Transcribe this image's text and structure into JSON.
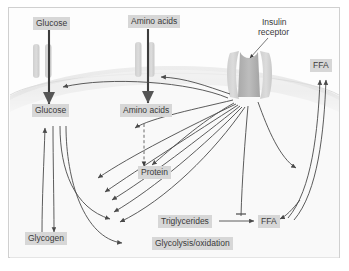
{
  "figure": {
    "frame": {
      "border_color": "#d0d0d0",
      "background": "#fdfdfd"
    },
    "style": {
      "label_box_fill": "#d7d7d7",
      "label_text_color": "#3a3a3a",
      "membrane_fill": "#e6e6e6",
      "transporter_fill": "#d2d2d2",
      "receptor_core_fill": "#b0b0b0",
      "arrow_color": "#4a4a4a"
    }
  },
  "extracellular": {
    "glucose": "Glucose",
    "amino_acids": "Amino acids",
    "insulin_receptor_line1": "Insulin",
    "insulin_receptor_line2": "receptor",
    "ffa": "FFA"
  },
  "intracellular": {
    "glucose": "Glucose",
    "amino_acids": "Amino acids",
    "protein": "Protein",
    "glycogen": "Glycogen",
    "triglycerides": "Triglycerides",
    "glycolysis": "Glycolysis/oxidation",
    "ffa": "FFA"
  },
  "nodes": [
    {
      "id": "glucose-out",
      "label": "Glucose",
      "compartment": "extracellular",
      "x": 33,
      "y": 18
    },
    {
      "id": "amino-acids-out",
      "label": "Amino acids",
      "compartment": "extracellular",
      "x": 130,
      "y": 16
    },
    {
      "id": "insulin-receptor",
      "label": "Insulin receptor",
      "compartment": "membrane",
      "x": 263,
      "y": 22
    },
    {
      "id": "ffa-out",
      "label": "FFA",
      "compartment": "extracellular",
      "x": 313,
      "y": 61
    },
    {
      "id": "glucose-in",
      "label": "Glucose",
      "compartment": "intracellular",
      "x": 36,
      "y": 113
    },
    {
      "id": "amino-acids-in",
      "label": "Amino acids",
      "compartment": "intracellular",
      "x": 123,
      "y": 112
    },
    {
      "id": "protein",
      "label": "Protein",
      "compartment": "intracellular",
      "x": 140,
      "y": 172
    },
    {
      "id": "glycogen",
      "label": "Glycogen",
      "compartment": "intracellular",
      "x": 30,
      "y": 238
    },
    {
      "id": "triglycerides",
      "label": "Triglycerides",
      "compartment": "intracellular",
      "x": 163,
      "y": 215
    },
    {
      "id": "glycolysis",
      "label": "Glycolysis/oxidation",
      "compartment": "intracellular",
      "x": 156,
      "y": 240
    },
    {
      "id": "ffa-in",
      "label": "FFA",
      "compartment": "intracellular",
      "x": 261,
      "y": 216
    }
  ],
  "edges": [
    {
      "from": "glucose-out",
      "to": "glucose-in",
      "style": "solid-thick"
    },
    {
      "from": "amino-acids-out",
      "to": "amino-acids-in",
      "style": "solid-thick"
    },
    {
      "from": "amino-acids-in",
      "to": "protein",
      "style": "dashed"
    },
    {
      "from": "triglycerides",
      "to": "ffa-in",
      "style": "solid"
    },
    {
      "from": "glycogen",
      "to": "glucose-in",
      "style": "solid"
    },
    {
      "from": "glucose-in",
      "to": "glycogen",
      "style": "solid"
    },
    {
      "from": "glucose-in",
      "to": "triglycerides",
      "style": "solid"
    },
    {
      "from": "glucose-in",
      "to": "glycolysis",
      "style": "solid"
    },
    {
      "from": "insulin-receptor",
      "to": "glucose-in",
      "style": "curved"
    },
    {
      "from": "insulin-receptor",
      "to": "amino-acids-in",
      "style": "curved"
    },
    {
      "from": "insulin-receptor",
      "to": "protein",
      "style": "curved"
    },
    {
      "from": "insulin-receptor",
      "to": "triglycerides",
      "style": "curved"
    },
    {
      "from": "insulin-receptor",
      "to": "glycolysis",
      "style": "curved"
    },
    {
      "from": "insulin-receptor",
      "to": "ffa-in",
      "style": "curved-inhibit"
    },
    {
      "from": "ffa-in",
      "to": "ffa-out",
      "style": "curved"
    }
  ]
}
